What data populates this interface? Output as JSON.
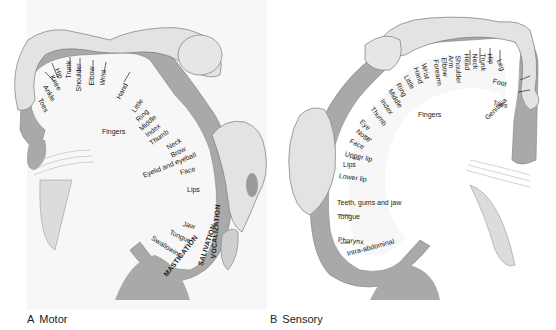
{
  "figure": {
    "panels": [
      {
        "id": "A",
        "letter": "A",
        "title": "Motor",
        "labels": {
          "toes": "Toes",
          "ankle": "Ankle",
          "knee": "Knee",
          "hip": "Hip",
          "trunk": "Trunk",
          "shoulder": "Shoulder",
          "elbow": "Elbow",
          "wrist": "Wrist",
          "hand": "Hand",
          "little": "Little",
          "ring": "Ring",
          "middle": "Middle",
          "index": "Index",
          "thumb": "Thumb",
          "fingers": "Fingers",
          "neck": "Neck",
          "brow": "Brow",
          "eyelid": "Eyelid and eyeball",
          "face": "Face",
          "lips": "Lips",
          "jaw": "Jaw",
          "tongue": "Tongue",
          "swallowing": "Swallowing",
          "mastication": "MASTICATION",
          "salivation": "SALIVATION",
          "vocalization": "VOCALIZATION"
        }
      },
      {
        "id": "B",
        "letter": "B",
        "title": "Sensory",
        "labels": {
          "genitalia": "Genitalia",
          "toes": "Toes",
          "foot": "Foot",
          "leg": "Leg",
          "hip": "Hip",
          "trunk": "Trunk",
          "neck": "Neck",
          "head": "Head",
          "shoulder": "Shoulder",
          "arm": "Arm",
          "elbow": "Elbow",
          "forearm": "Forearm",
          "wrist": "Wrist",
          "hand": "Hand",
          "little": "Little",
          "ring": "Ring",
          "middle": "Middle",
          "index": "Index",
          "thumb": "Thumb",
          "fingers": "Fingers",
          "eye": "Eye",
          "nose": "Nose",
          "face": "Face",
          "upper_lip": "Upper lip",
          "lips": "Lips",
          "lower_lip": "Lower lip",
          "teeth": "Teeth, gums and jaw",
          "tongue": "Tongue",
          "pharynx": "Pharynx",
          "intra_abdominal": "Intra-abdominal"
        }
      }
    ]
  },
  "colors": {
    "cortex": "#a9a9a9",
    "background": "#f7f7f7",
    "outline": "#7a7a7a",
    "body": "#e3e3e3"
  }
}
